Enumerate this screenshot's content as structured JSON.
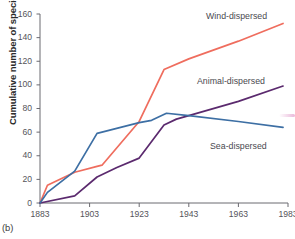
{
  "figure": {
    "panel_label": "(b)",
    "ylabel": "Cumulative number of species",
    "xlabel": ""
  },
  "axes": {
    "yticks": [
      0,
      20,
      40,
      60,
      80,
      100,
      120,
      140,
      160
    ],
    "xticks": [
      1883,
      1903,
      1923,
      1943,
      1963,
      1983
    ]
  },
  "labels": {
    "wind": "Wind-dispersed",
    "animal": "Animal-dispersed",
    "sea": "Sea-dispersed"
  },
  "colors": {
    "wind": "#ef6d5e",
    "animal": "#5b2a6e",
    "sea": "#3d6fa4",
    "axis": "#6b6a70",
    "text": "#4a4a50"
  },
  "chart_data": {
    "type": "line",
    "title": "",
    "xlabel": "",
    "ylabel": "Cumulative number of species",
    "xlim": [
      1883,
      1983
    ],
    "ylim": [
      0,
      160
    ],
    "grid": false,
    "legend": "inline-right",
    "xticks": [
      1883,
      1903,
      1923,
      1943,
      1963,
      1983
    ],
    "yticks": [
      0,
      20,
      40,
      60,
      80,
      100,
      120,
      140,
      160
    ],
    "series": [
      {
        "name": "Wind-dispersed",
        "color": "#ef6d5e",
        "points": [
          [
            1883,
            0
          ],
          [
            1886,
            15
          ],
          [
            1897,
            26
          ],
          [
            1906,
            31
          ],
          [
            1908,
            32
          ],
          [
            1923,
            69
          ],
          [
            1933,
            113
          ],
          [
            1943,
            122
          ],
          [
            1963,
            137
          ],
          [
            1981,
            152
          ]
        ]
      },
      {
        "name": "Animal-dispersed",
        "color": "#5b2a6e",
        "points": [
          [
            1883,
            0
          ],
          [
            1897,
            6
          ],
          [
            1906,
            22
          ],
          [
            1914,
            30
          ],
          [
            1923,
            38
          ],
          [
            1933,
            66
          ],
          [
            1938,
            71
          ],
          [
            1943,
            74
          ],
          [
            1963,
            86
          ],
          [
            1981,
            99
          ]
        ]
      },
      {
        "name": "Sea-dispersed",
        "color": "#3d6fa4",
        "points": [
          [
            1883,
            0
          ],
          [
            1886,
            9
          ],
          [
            1897,
            27
          ],
          [
            1906,
            59
          ],
          [
            1908,
            60
          ],
          [
            1923,
            68
          ],
          [
            1928,
            70
          ],
          [
            1934,
            76
          ],
          [
            1943,
            74
          ],
          [
            1963,
            69
          ],
          [
            1981,
            64
          ]
        ]
      }
    ],
    "annotations": [
      {
        "text": "Wind-dispersed",
        "near": [
          1958,
          158
        ]
      },
      {
        "text": "Animal-dispersed",
        "near": [
          1955,
          105
        ]
      },
      {
        "text": "Sea-dispersed",
        "near": [
          1957,
          58
        ]
      }
    ]
  }
}
